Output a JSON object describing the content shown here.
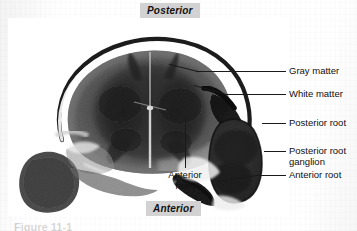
{
  "figure": {
    "background_color": "#fdfdfd",
    "ink_color": "#101010"
  },
  "orientation_labels": [
    {
      "id": "posterior",
      "text": "Posterior",
      "chip_color": "#d2d2d2",
      "position": "top-center"
    },
    {
      "id": "anterior",
      "text": "Anterior",
      "chip_color": "#d2d2d2",
      "position": "bottom-center"
    }
  ],
  "callouts": [
    {
      "id": "gray-matter",
      "text": "Gray matter",
      "line_from": "specimen-central-gray",
      "side": "right"
    },
    {
      "id": "white-matter",
      "text": "White matter",
      "line_from": "specimen-outer-white",
      "side": "right"
    },
    {
      "id": "posterior-root",
      "text": "Posterior root",
      "line_from": "specimen-posterior-root",
      "side": "right"
    },
    {
      "id": "posterior-root-ganglion",
      "text": "Posterior root ganglion",
      "line_from": "specimen-ganglion",
      "side": "right"
    },
    {
      "id": "anterior-root",
      "text": "Anterior root",
      "line_from": "specimen-anterior-root",
      "side": "right"
    },
    {
      "id": "anterior-horn",
      "text": "Anterior horn",
      "line_from": "specimen-anterior-horn",
      "side": "below"
    }
  ],
  "callout_text": {
    "gray_matter": "Gray matter",
    "white_matter": "White matter",
    "posterior_root": "Posterior root",
    "posterior_root_ganglion_line1": "Posterior root",
    "posterior_root_ganglion_line2": "ganglion",
    "anterior_root": "Anterior root",
    "anterior_horn_line1": "Anterior",
    "anterior_horn_line2": "horn"
  },
  "caption": {
    "partial_text": "Figure 11-1"
  }
}
